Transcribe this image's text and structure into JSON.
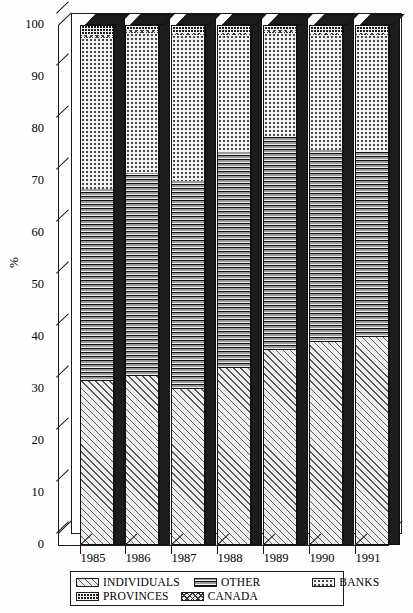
{
  "chart_data": {
    "type": "bar",
    "subtype": "stacked-percentage-3d",
    "title": "",
    "xlabel": "",
    "ylabel": "%",
    "ylim": [
      0,
      100
    ],
    "yticks": [
      0,
      10,
      20,
      30,
      40,
      50,
      60,
      70,
      80,
      90,
      100
    ],
    "ytick_labels": [
      "0",
      "10",
      "20",
      "30",
      "40",
      "50",
      "60",
      "70",
      "80",
      "90",
      "100"
    ],
    "grid": false,
    "legend_position": "bottom",
    "categories": [
      "1985",
      "1986",
      "1987",
      "1988",
      "1989",
      "1990",
      "1991"
    ],
    "stack_order_bottom_to_top": [
      "INDIVIDUALS",
      "OTHER",
      "BANKS",
      "CANADA",
      "PROVINCES"
    ],
    "series": [
      {
        "name": "INDIVIDUALS",
        "pattern": "diagonal-hatch",
        "values": [
          31.5,
          32.5,
          30.0,
          34.0,
          37.5,
          39.0,
          40.0
        ]
      },
      {
        "name": "OTHER",
        "pattern": "horizontal-lines",
        "values": [
          37.0,
          39.0,
          40.0,
          41.5,
          41.0,
          37.0,
          35.5
        ]
      },
      {
        "name": "BANKS",
        "pattern": "fine-dots",
        "values": [
          29.0,
          27.0,
          28.0,
          22.5,
          20.0,
          22.0,
          22.5
        ]
      },
      {
        "name": "CANADA",
        "pattern": "cross-hatch",
        "values": [
          0.5,
          0.5,
          0.5,
          0.5,
          0.5,
          0.5,
          0.5
        ]
      },
      {
        "name": "PROVINCES",
        "pattern": "checkerboard",
        "values": [
          2.0,
          1.0,
          1.5,
          1.5,
          1.0,
          1.5,
          1.5
        ]
      }
    ]
  },
  "legend": {
    "items": [
      {
        "label": "INDIVIDUALS",
        "pattern": "diagonal-hatch"
      },
      {
        "label": "OTHER",
        "pattern": "horizontal-lines"
      },
      {
        "label": "BANKS",
        "pattern": "fine-dots"
      },
      {
        "label": "PROVINCES",
        "pattern": "checkerboard"
      },
      {
        "label": "CANADA",
        "pattern": "cross-hatch"
      }
    ]
  }
}
